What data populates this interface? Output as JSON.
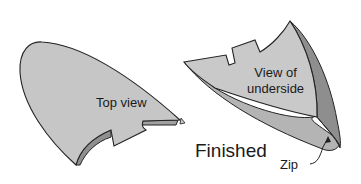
{
  "diagram": {
    "title": "Finished",
    "colors": {
      "surface": "#c4c4c4",
      "surface_dark": "#9a9a9a",
      "surface_shade": "#b0b0b0",
      "outline": "#222222",
      "text": "#1a1a1a"
    },
    "parts": [
      {
        "id": "top-view",
        "label": "Top view"
      },
      {
        "id": "underside-view",
        "label_line1": "View of",
        "label_line2": "underside"
      }
    ],
    "annotations": {
      "finished_label": "Finished",
      "zip_label": "Zip"
    }
  }
}
